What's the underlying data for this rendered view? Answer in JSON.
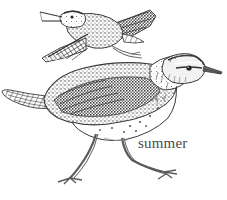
{
  "plate": {
    "title": "Spotted Sandpiper plate",
    "background_color": "#ffffff",
    "ink_color": "#3a3a3a",
    "medium": "pen-and-ink stipple illustration",
    "width": 227,
    "height": 200
  },
  "labels": {
    "season": "summer",
    "season_color": "#4a4a4a"
  },
  "figures": [
    {
      "id": "flying-bird",
      "name": "sandpiper-in-flight",
      "pose": "flying, wings spread, bill open",
      "position": "upper-left",
      "bbox": [
        38,
        4,
        155,
        62
      ],
      "features": [
        "open bill calling",
        "dark primaries with pale tips",
        "white wing stripe",
        "trailing legs and feet",
        "mottled brown upperparts"
      ]
    },
    {
      "id": "standing-bird",
      "name": "sandpiper-standing",
      "pose": "standing, walking, facing right",
      "position": "lower-centre",
      "bbox": [
        2,
        50,
        222,
        180
      ],
      "features": [
        "long straight bill",
        "dark eye-stripe and pale supercilium",
        "spotted white underparts",
        "barred and mottled mantle",
        "two legs, one stepping forward",
        "long tail extending left"
      ]
    }
  ]
}
